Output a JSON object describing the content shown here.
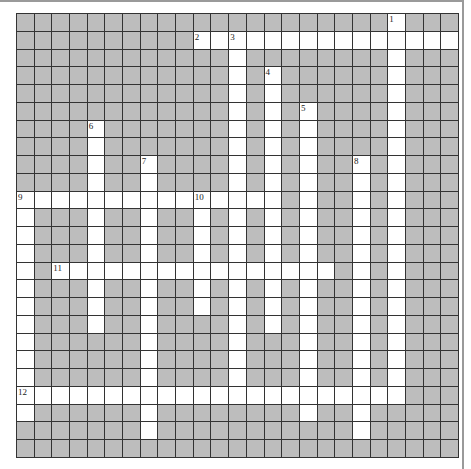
{
  "puzzle": {
    "rows": 25,
    "cols": 25,
    "colors": {
      "block": "#bdbdbd",
      "open": "#ffffff",
      "gridline": "#333333"
    },
    "entries": [
      {
        "number": "1",
        "direction": "down",
        "row": 0,
        "col": 21,
        "length": 22
      },
      {
        "number": "2",
        "direction": "across",
        "row": 1,
        "col": 10,
        "length": 15
      },
      {
        "number": "3",
        "direction": "down",
        "row": 1,
        "col": 12,
        "length": 21
      },
      {
        "number": "4",
        "direction": "down",
        "row": 3,
        "col": 14,
        "length": 15
      },
      {
        "number": "5",
        "direction": "down",
        "row": 5,
        "col": 16,
        "length": 18
      },
      {
        "number": "6",
        "direction": "down",
        "row": 6,
        "col": 4,
        "length": 12
      },
      {
        "number": "7",
        "direction": "down",
        "row": 8,
        "col": 7,
        "length": 16
      },
      {
        "number": "8",
        "direction": "down",
        "row": 8,
        "col": 19,
        "length": 16
      },
      {
        "number": "9",
        "direction": "across",
        "row": 10,
        "col": 0,
        "length": 15
      },
      {
        "number": "9",
        "direction": "down",
        "row": 10,
        "col": 0,
        "length": 13
      },
      {
        "number": "10",
        "direction": "down",
        "row": 10,
        "col": 10,
        "length": 7
      },
      {
        "number": "11",
        "direction": "across",
        "row": 14,
        "col": 2,
        "length": 16
      },
      {
        "number": "12",
        "direction": "across",
        "row": 21,
        "col": 0,
        "length": 22
      }
    ]
  }
}
